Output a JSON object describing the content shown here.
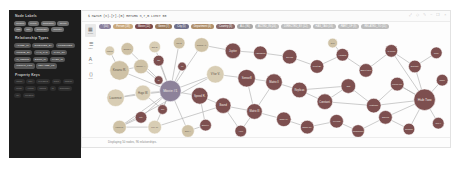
{
  "app": {
    "name": "graph-database-browser",
    "background": "#ffffff",
    "panel_bg": "#fdfdfd",
    "sidebar_bg": "#1d1d1d"
  },
  "sidebar": {
    "sections": [
      {
        "id": "node-labels",
        "title": "Node Labels",
        "chips": [
          {
            "label": "Person"
          },
          {
            "label": "Movie"
          },
          {
            "label": "Character"
          },
          {
            "label": "Genre"
          },
          {
            "label": "Tag"
          },
          {
            "label": "City"
          },
          {
            "label": "Company"
          },
          {
            "label": "Country"
          }
        ]
      },
      {
        "id": "relationship-types",
        "title": "Relationship Types",
        "chips": [
          {
            "label": "ACTED_IN"
          },
          {
            "label": "DIRECTED_BY"
          },
          {
            "label": "PRODUCED"
          },
          {
            "label": "WROTE_BY"
          },
          {
            "label": "HAS_TAG"
          },
          {
            "label": "PART_OF"
          },
          {
            "label": "IS_GENRE"
          },
          {
            "label": "BORN_IN"
          },
          {
            "label": "LIVES_IN"
          },
          {
            "label": "WORKS_FOR"
          },
          {
            "label": "RELATED_TO"
          }
        ]
      },
      {
        "id": "property-keys",
        "title": "Property Keys",
        "chips": [
          {
            "label": "name"
          },
          {
            "label": "title"
          },
          {
            "label": "released"
          },
          {
            "label": "born"
          },
          {
            "label": "tagline"
          },
          {
            "label": "roles"
          },
          {
            "label": "votes"
          },
          {
            "label": "rating"
          },
          {
            "label": "id"
          },
          {
            "label": "summary"
          },
          {
            "label": "url"
          },
          {
            "label": "created"
          }
        ]
      }
    ]
  },
  "topbar": {
    "query": "$ MATCH (n)-[r]-(m) RETURN n,r,m LIMIT 50",
    "icons": [
      {
        "name": "expand-icon",
        "glyph": "⤢"
      },
      {
        "name": "pin-icon",
        "glyph": "◇"
      },
      {
        "name": "edit-icon",
        "glyph": "✎"
      },
      {
        "name": "minimize-icon",
        "glyph": "−"
      },
      {
        "name": "fullscreen-icon",
        "glyph": "❐"
      },
      {
        "name": "close-icon",
        "glyph": "×"
      }
    ]
  },
  "legend": {
    "chips": [
      {
        "label": "* (50)",
        "color": "#8a7f9c"
      },
      {
        "label": "Person (18)",
        "color": "#c9a87c"
      },
      {
        "label": "Movie (12)",
        "color": "#7b4a4a"
      },
      {
        "label": "Genre (7)",
        "color": "#9c7b5c"
      },
      {
        "label": "City (5)",
        "color": "#6f6f8a"
      },
      {
        "label": "Department (4)",
        "color": "#b08f6a"
      },
      {
        "label": "Country (3)",
        "color": "#8a6a6a"
      },
      {
        "label": "ALL (96)",
        "color": "#a8a8a8"
      },
      {
        "label": "ACTED_IN (24)",
        "color": "#bdbdbd"
      },
      {
        "label": "DIRECTED_BY (12)",
        "color": "#bdbdbd"
      },
      {
        "label": "HAS_TAG (16)",
        "color": "#bdbdbd"
      },
      {
        "label": "PART_OF (9)",
        "color": "#bdbdbd"
      },
      {
        "label": "RELATED_TO (11)",
        "color": "#bdbdbd"
      }
    ]
  },
  "rail": {
    "buttons": [
      {
        "name": "graph-view-button",
        "caption": "Graph",
        "glyph": "▦",
        "active": true
      },
      {
        "name": "table-view-button",
        "caption": "Table",
        "glyph": "☰",
        "active": false
      },
      {
        "name": "text-view-button",
        "caption": "Text",
        "glyph": "A",
        "active": false
      },
      {
        "name": "code-view-button",
        "caption": "Code",
        "glyph": "⟨⟩",
        "active": false
      }
    ]
  },
  "status": {
    "text": "Displaying 50 nodes, 96 relationships."
  },
  "graph": {
    "node_colors": {
      "hub": "#8d829a",
      "beige": "#cfc2a6",
      "beige_light": "#d8cdb4",
      "maroon": "#7d4f4f",
      "maroon_dark": "#6d4343",
      "slate": "#8a8a9e"
    },
    "edge_color": "#b4b4b4",
    "nodes": [
      {
        "id": "n1",
        "cx": 74,
        "cy": 55,
        "r": 11,
        "color": "hub",
        "label": "Movie #1"
      },
      {
        "id": "n2",
        "cx": 22,
        "cy": 34,
        "r": 10,
        "color": "beige",
        "label": "Keanu R."
      },
      {
        "id": "n3",
        "cx": 18,
        "cy": 62,
        "r": 9,
        "color": "beige_light",
        "label": "Laurence"
      },
      {
        "id": "n4",
        "cx": 44,
        "cy": 30,
        "r": 7.5,
        "color": "beige",
        "label": "Carrie A."
      },
      {
        "id": "n5",
        "cx": 46,
        "cy": 57,
        "r": 8,
        "color": "beige_light",
        "label": "Hugo W."
      },
      {
        "id": "n6",
        "cx": 30,
        "cy": 12,
        "r": 6.5,
        "color": "beige",
        "label": "Gloria F."
      },
      {
        "id": "n7",
        "cx": 58,
        "cy": 10,
        "r": 6,
        "color": "beige_light",
        "label": "Emil E."
      },
      {
        "id": "n8",
        "cx": 83,
        "cy": 6,
        "r": 6,
        "color": "beige",
        "label": "Joel S."
      },
      {
        "id": "n9",
        "cx": 62,
        "cy": 24,
        "r": 5.5,
        "color": "maroon",
        "label": "Tag"
      },
      {
        "id": "n10",
        "cx": 44,
        "cy": 82,
        "r": 6,
        "color": "maroon",
        "label": "City"
      },
      {
        "id": "n11",
        "cx": 22,
        "cy": 92,
        "r": 7,
        "color": "beige",
        "label": "Lana W."
      },
      {
        "id": "n12",
        "cx": 58,
        "cy": 92,
        "r": 7,
        "color": "beige_light",
        "label": "Lilly W."
      },
      {
        "id": "n13",
        "cx": 66,
        "cy": 74,
        "r": 5,
        "color": "maroon",
        "label": "Gen"
      },
      {
        "id": "n14",
        "cx": 106,
        "cy": 8,
        "r": 7.5,
        "color": "beige",
        "label": "Cloud At."
      },
      {
        "id": "n15",
        "cx": 120,
        "cy": 38,
        "r": 9,
        "color": "beige_light",
        "label": "V for V."
      },
      {
        "id": "n16",
        "cx": 104,
        "cy": 60,
        "r": 8.5,
        "color": "maroon",
        "label": "Speed R."
      },
      {
        "id": "n17",
        "cx": 138,
        "cy": 14,
        "r": 8,
        "color": "maroon",
        "label": "Jupiter"
      },
      {
        "id": "n18",
        "cx": 152,
        "cy": 42,
        "r": 9,
        "color": "maroon",
        "label": "Sense8"
      },
      {
        "id": "n19",
        "cx": 128,
        "cy": 70,
        "r": 8,
        "color": "maroon",
        "label": "Bound"
      },
      {
        "id": "n20",
        "cx": 166,
        "cy": 16,
        "r": 7,
        "color": "maroon",
        "label": "Assassins"
      },
      {
        "id": "n21",
        "cx": 180,
        "cy": 46,
        "r": 8.5,
        "color": "maroon",
        "label": "Matrix II"
      },
      {
        "id": "n22",
        "cx": 160,
        "cy": 76,
        "r": 8,
        "color": "maroon",
        "label": "Matrix III"
      },
      {
        "id": "n23",
        "cx": 196,
        "cy": 20,
        "r": 7.5,
        "color": "maroon",
        "label": "Devils"
      },
      {
        "id": "n24",
        "cx": 206,
        "cy": 54,
        "r": 8,
        "color": "maroon",
        "label": "Replicas"
      },
      {
        "id": "n25",
        "cx": 190,
        "cy": 84,
        "r": 7.5,
        "color": "maroon",
        "label": "John W."
      },
      {
        "id": "n26",
        "cx": 224,
        "cy": 30,
        "r": 7,
        "color": "maroon",
        "label": "Point Br."
      },
      {
        "id": "n27",
        "cx": 232,
        "cy": 66,
        "r": 8,
        "color": "maroon",
        "label": "Constant."
      },
      {
        "id": "n28",
        "cx": 214,
        "cy": 92,
        "r": 7,
        "color": "maroon",
        "label": "Chain Re."
      },
      {
        "id": "n29",
        "cx": 250,
        "cy": 18,
        "r": 6.5,
        "color": "maroon",
        "label": "Hardball"
      },
      {
        "id": "n30",
        "cx": 256,
        "cy": 50,
        "r": 7.5,
        "color": "maroon",
        "label": "Gift"
      },
      {
        "id": "n31",
        "cx": 244,
        "cy": 86,
        "r": 7,
        "color": "maroon",
        "label": "Feeling"
      },
      {
        "id": "n32",
        "cx": 274,
        "cy": 34,
        "r": 7,
        "color": "maroon",
        "label": "Sweet Nov"
      },
      {
        "id": "n33",
        "cx": 282,
        "cy": 70,
        "r": 7.5,
        "color": "maroon",
        "label": "Watcher"
      },
      {
        "id": "n34",
        "cx": 266,
        "cy": 96,
        "r": 6.5,
        "color": "maroon",
        "label": "Thumbsuck"
      },
      {
        "id": "n35",
        "cx": 300,
        "cy": 14,
        "r": 6.5,
        "color": "maroon",
        "label": "47 Ronin"
      },
      {
        "id": "n36",
        "cx": 306,
        "cy": 48,
        "r": 7,
        "color": "maroon",
        "label": "Knock Kn."
      },
      {
        "id": "n37",
        "cx": 294,
        "cy": 82,
        "r": 7,
        "color": "maroon",
        "label": "Siberia"
      },
      {
        "id": "n38",
        "cx": 324,
        "cy": 30,
        "r": 6.5,
        "color": "maroon",
        "label": "Destinat."
      },
      {
        "id": "n39",
        "cx": 334,
        "cy": 64,
        "r": 11,
        "color": "maroon",
        "label": "Hub Two"
      },
      {
        "id": "n40",
        "cx": 318,
        "cy": 94,
        "r": 6,
        "color": "maroon",
        "label": "Exposed"
      },
      {
        "id": "n41",
        "cx": 346,
        "cy": 16,
        "r": 6,
        "color": "maroon",
        "label": "Neon"
      },
      {
        "id": "n42",
        "cx": 352,
        "cy": 44,
        "r": 6,
        "color": "maroon",
        "label": "Whole"
      },
      {
        "id": "n43",
        "cx": 348,
        "cy": 88,
        "r": 6,
        "color": "maroon",
        "label": "Gen-X"
      },
      {
        "id": "n44",
        "cx": 92,
        "cy": 96,
        "r": 6.5,
        "color": "beige",
        "label": "Tom A."
      },
      {
        "id": "n45",
        "cx": 12,
        "cy": 14,
        "r": 5,
        "color": "beige_light",
        "label": "Marcus"
      },
      {
        "id": "n46",
        "cx": 240,
        "cy": 6,
        "r": 5,
        "color": "beige",
        "label": "Dept"
      },
      {
        "id": "n47",
        "cx": 86,
        "cy": 30,
        "r": 4.5,
        "color": "maroon",
        "label": "Tg"
      },
      {
        "id": "n48",
        "cx": 62,
        "cy": 44,
        "r": 4.5,
        "color": "maroon",
        "label": "Ct"
      },
      {
        "id": "n49",
        "cx": 146,
        "cy": 96,
        "r": 6,
        "color": "maroon",
        "label": "Aeon"
      },
      {
        "id": "n50",
        "cx": 110,
        "cy": 90,
        "r": 6,
        "color": "maroon",
        "label": "Street K."
      }
    ],
    "edges": [
      [
        "n1",
        "n2"
      ],
      [
        "n1",
        "n3"
      ],
      [
        "n1",
        "n4"
      ],
      [
        "n1",
        "n5"
      ],
      [
        "n1",
        "n6"
      ],
      [
        "n1",
        "n7"
      ],
      [
        "n1",
        "n8"
      ],
      [
        "n1",
        "n9"
      ],
      [
        "n1",
        "n10"
      ],
      [
        "n1",
        "n11"
      ],
      [
        "n1",
        "n12"
      ],
      [
        "n1",
        "n13"
      ],
      [
        "n1",
        "n47"
      ],
      [
        "n1",
        "n48"
      ],
      [
        "n1",
        "n44"
      ],
      [
        "n1",
        "n14"
      ],
      [
        "n1",
        "n15"
      ],
      [
        "n1",
        "n16"
      ],
      [
        "n11",
        "n15"
      ],
      [
        "n12",
        "n19"
      ],
      [
        "n14",
        "n17"
      ],
      [
        "n15",
        "n18"
      ],
      [
        "n16",
        "n19"
      ],
      [
        "n17",
        "n20"
      ],
      [
        "n18",
        "n21"
      ],
      [
        "n19",
        "n22"
      ],
      [
        "n20",
        "n23"
      ],
      [
        "n21",
        "n24"
      ],
      [
        "n22",
        "n25"
      ],
      [
        "n23",
        "n26"
      ],
      [
        "n24",
        "n27"
      ],
      [
        "n25",
        "n28"
      ],
      [
        "n26",
        "n29"
      ],
      [
        "n27",
        "n30"
      ],
      [
        "n28",
        "n31"
      ],
      [
        "n29",
        "n32"
      ],
      [
        "n30",
        "n33"
      ],
      [
        "n31",
        "n34"
      ],
      [
        "n32",
        "n35"
      ],
      [
        "n33",
        "n36"
      ],
      [
        "n34",
        "n37"
      ],
      [
        "n35",
        "n38"
      ],
      [
        "n36",
        "n39"
      ],
      [
        "n37",
        "n40"
      ],
      [
        "n38",
        "n41"
      ],
      [
        "n39",
        "n42"
      ],
      [
        "n39",
        "n43"
      ],
      [
        "n39",
        "n38"
      ],
      [
        "n39",
        "n36"
      ],
      [
        "n39",
        "n37"
      ],
      [
        "n39",
        "n40"
      ],
      [
        "n39",
        "n33"
      ],
      [
        "n39",
        "n35"
      ],
      [
        "n18",
        "n22"
      ],
      [
        "n21",
        "n22"
      ],
      [
        "n24",
        "n30"
      ],
      [
        "n27",
        "n33"
      ],
      [
        "n16",
        "n50"
      ],
      [
        "n19",
        "n49"
      ],
      [
        "n50",
        "n44"
      ],
      [
        "n49",
        "n22"
      ],
      [
        "n46",
        "n29"
      ],
      [
        "n45",
        "n2"
      ],
      [
        "n2",
        "n4"
      ],
      [
        "n3",
        "n5"
      ],
      [
        "n11",
        "n12"
      ],
      [
        "n5",
        "n13"
      ],
      [
        "n10",
        "n11"
      ]
    ]
  }
}
